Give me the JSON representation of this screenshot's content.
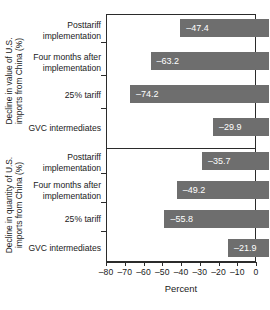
{
  "chart_data": {
    "type": "bar",
    "orientation": "horizontal",
    "title": "",
    "xlabel": "Percent",
    "xlim": [
      -80,
      0
    ],
    "xticks": [
      -80,
      -70,
      -60,
      -50,
      -40,
      -30,
      -20,
      -10,
      0
    ],
    "xticklabels": [
      "–80",
      "–70",
      "–60",
      "–50",
      "–40",
      "–30",
      "–20",
      "–10",
      "0"
    ],
    "grid": false,
    "legend": null,
    "categories": [
      "Posttariff implementation",
      "Four months after implementation",
      "25% tariff",
      "GVC intermediates"
    ],
    "panels": [
      {
        "ylabel": "Decline in value of U.S. imports from China (%)",
        "ylabel_line1": "Decline in value of U.S.",
        "ylabel_line2": "imports from China (%)",
        "categories": [
          {
            "label_line1": "Posttariff",
            "label_line2": "implementation",
            "value": -47.4,
            "value_label": "–47.4"
          },
          {
            "label_line1": "Four months after",
            "label_line2": "implementation",
            "value": -63.2,
            "value_label": "–63.2"
          },
          {
            "label_line1": "25% tariff",
            "label_line2": "",
            "value": -74.2,
            "value_label": "–74.2"
          },
          {
            "label_line1": "GVC intermediates",
            "label_line2": "",
            "value": -29.9,
            "value_label": "–29.9"
          }
        ]
      },
      {
        "ylabel": "Decline in quantity of U.S. imports from China (%)",
        "ylabel_line1": "Decline in quantity of U.S.",
        "ylabel_line2": "imports from China (%)",
        "categories": [
          {
            "label_line1": "Posttariff",
            "label_line2": "implementation",
            "value": -35.7,
            "value_label": "–35.7"
          },
          {
            "label_line1": "Four months after",
            "label_line2": "implementation",
            "value": -49.2,
            "value_label": "–49.2"
          },
          {
            "label_line1": "25% tariff",
            "label_line2": "",
            "value": -55.8,
            "value_label": "–55.8"
          },
          {
            "label_line1": "GVC intermediates",
            "label_line2": "",
            "value": -21.9,
            "value_label": "–21.9"
          }
        ]
      }
    ],
    "colors": {
      "bar": "#6e6e6e",
      "bar_label": "#ffffff",
      "axis": "#2b2b2b",
      "background": "#ffffff"
    }
  }
}
